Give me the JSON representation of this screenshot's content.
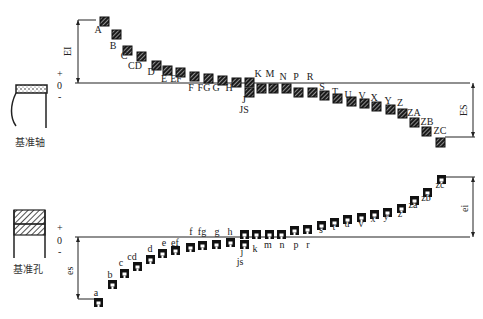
{
  "diagram": {
    "shaft_system": {
      "reference_label": "基准轴",
      "sign_labels": [
        "+",
        "0",
        "-"
      ],
      "left_dimension": "EI",
      "right_dimension": "ES",
      "zero_line": {
        "x1": 75,
        "x2": 470,
        "y": 83
      },
      "zones": [
        {
          "label": "A",
          "x": 100,
          "y": 17,
          "lx": 98,
          "ly": 33,
          "side": "above"
        },
        {
          "label": "B",
          "x": 112,
          "y": 30,
          "lx": 113,
          "ly": 49,
          "side": "above"
        },
        {
          "label": "C",
          "x": 123,
          "y": 46,
          "lx": 124,
          "ly": 59,
          "side": "above"
        },
        {
          "label": "CD",
          "x": 137,
          "y": 52,
          "lx": 135,
          "ly": 69,
          "side": "above"
        },
        {
          "label": "D",
          "x": 152,
          "y": 61,
          "lx": 151,
          "ly": 75,
          "side": "above"
        },
        {
          "label": "E",
          "x": 163,
          "y": 66,
          "lx": 164,
          "ly": 82,
          "side": "above"
        },
        {
          "label": "EF",
          "x": 176,
          "y": 68,
          "lx": 176,
          "ly": 82,
          "side": "above"
        },
        {
          "label": "F",
          "x": 190,
          "y": 72,
          "lx": 191,
          "ly": 91,
          "side": "above"
        },
        {
          "label": "FG",
          "x": 204,
          "y": 74,
          "lx": 204,
          "ly": 91,
          "side": "above"
        },
        {
          "label": "G",
          "x": 218,
          "y": 76,
          "lx": 216,
          "ly": 91,
          "side": "above"
        },
        {
          "label": "H",
          "x": 232,
          "y": 78,
          "lx": 229,
          "ly": 91,
          "side": "above"
        },
        {
          "label": "J",
          "x": 245,
          "y": 78,
          "lx": 244,
          "ly": 103,
          "side": "both"
        },
        {
          "label": "JS",
          "x": 245,
          "y": 88,
          "lx": 244,
          "ly": 113,
          "side": "both"
        },
        {
          "label": "K",
          "x": 257,
          "y": 84,
          "lx": 258,
          "ly": 77,
          "side": "below"
        },
        {
          "label": "M",
          "x": 269,
          "y": 84,
          "lx": 270,
          "ly": 77,
          "side": "below"
        },
        {
          "label": "N",
          "x": 282,
          "y": 84,
          "lx": 283,
          "ly": 80,
          "side": "below"
        },
        {
          "label": "P",
          "x": 294,
          "y": 88,
          "lx": 296,
          "ly": 80,
          "side": "below"
        },
        {
          "label": "R",
          "x": 308,
          "y": 88,
          "lx": 310,
          "ly": 80,
          "side": "below"
        },
        {
          "label": "S",
          "x": 320,
          "y": 91,
          "lx": 322,
          "ly": 90,
          "side": "below"
        },
        {
          "label": "T",
          "x": 333,
          "y": 94,
          "lx": 335,
          "ly": 95,
          "side": "below"
        },
        {
          "label": "U",
          "x": 347,
          "y": 97,
          "lx": 348,
          "ly": 98,
          "side": "below"
        },
        {
          "label": "V",
          "x": 360,
          "y": 99,
          "lx": 362,
          "ly": 99,
          "side": "below"
        },
        {
          "label": "X",
          "x": 372,
          "y": 102,
          "lx": 374,
          "ly": 101,
          "side": "below"
        },
        {
          "label": "Y",
          "x": 386,
          "y": 105,
          "lx": 388,
          "ly": 104,
          "side": "below"
        },
        {
          "label": "Z",
          "x": 398,
          "y": 109,
          "lx": 400,
          "ly": 106,
          "side": "below"
        },
        {
          "label": "ZA",
          "x": 410,
          "y": 118,
          "lx": 414,
          "ly": 116,
          "side": "below"
        },
        {
          "label": "ZB",
          "x": 422,
          "y": 127,
          "lx": 427,
          "ly": 125,
          "side": "below"
        },
        {
          "label": "ZC",
          "x": 436,
          "y": 138,
          "lx": 440,
          "ly": 134,
          "side": "below"
        }
      ]
    },
    "hole_system": {
      "reference_label": "基准孔",
      "sign_labels": [
        "+",
        "0",
        "-"
      ],
      "left_dimension": "es",
      "right_dimension": "ei",
      "zero_line": {
        "x1": 75,
        "x2": 470,
        "y": 237
      },
      "zones": [
        {
          "label": "a",
          "x": 94,
          "y": 298,
          "lx": 96,
          "ly": 296
        },
        {
          "label": "b",
          "x": 108,
          "y": 280,
          "lx": 110,
          "ly": 278
        },
        {
          "label": "c",
          "x": 120,
          "y": 269,
          "lx": 121,
          "ly": 266
        },
        {
          "label": "cd",
          "x": 133,
          "y": 262,
          "lx": 132,
          "ly": 260
        },
        {
          "label": "d",
          "x": 146,
          "y": 255,
          "lx": 150,
          "ly": 252
        },
        {
          "label": "e",
          "x": 158,
          "y": 249,
          "lx": 164,
          "ly": 246
        },
        {
          "label": "ef",
          "x": 171,
          "y": 246,
          "lx": 175,
          "ly": 246
        },
        {
          "label": "f",
          "x": 186,
          "y": 243,
          "lx": 191,
          "ly": 235
        },
        {
          "label": "fg",
          "x": 198,
          "y": 241,
          "lx": 202,
          "ly": 235
        },
        {
          "label": "g",
          "x": 212,
          "y": 240,
          "lx": 217,
          "ly": 235
        },
        {
          "label": "h",
          "x": 226,
          "y": 238,
          "lx": 230,
          "ly": 235
        },
        {
          "label": "j",
          "x": 240,
          "y": 230,
          "lx": 242,
          "ly": 255
        },
        {
          "label": "js",
          "x": 240,
          "y": 240,
          "lx": 240,
          "ly": 265
        },
        {
          "label": "k",
          "x": 252,
          "y": 230,
          "lx": 255,
          "ly": 252
        },
        {
          "label": "m",
          "x": 265,
          "y": 230,
          "lx": 268,
          "ly": 248
        },
        {
          "label": "n",
          "x": 277,
          "y": 230,
          "lx": 282,
          "ly": 248
        },
        {
          "label": "p",
          "x": 290,
          "y": 226,
          "lx": 296,
          "ly": 248
        },
        {
          "label": "r",
          "x": 303,
          "y": 225,
          "lx": 308,
          "ly": 248
        },
        {
          "label": "s",
          "x": 317,
          "y": 221,
          "lx": 321,
          "ly": 233
        },
        {
          "label": "t",
          "x": 330,
          "y": 218,
          "lx": 334,
          "ly": 230
        },
        {
          "label": "u",
          "x": 343,
          "y": 215,
          "lx": 347,
          "ly": 227
        },
        {
          "label": "v",
          "x": 357,
          "y": 213,
          "lx": 361,
          "ly": 227
        },
        {
          "label": "x",
          "x": 370,
          "y": 210,
          "lx": 373,
          "ly": 222
        },
        {
          "label": "y",
          "x": 383,
          "y": 208,
          "lx": 386,
          "ly": 220
        },
        {
          "label": "z",
          "x": 397,
          "y": 204,
          "lx": 400,
          "ly": 217
        },
        {
          "label": "za",
          "x": 410,
          "y": 196,
          "lx": 413,
          "ly": 208
        },
        {
          "label": "zb",
          "x": 423,
          "y": 188,
          "lx": 426,
          "ly": 201
        },
        {
          "label": "zc",
          "x": 437,
          "y": 175,
          "lx": 440,
          "ly": 188
        }
      ]
    }
  }
}
